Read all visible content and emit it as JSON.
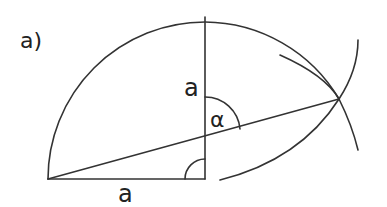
{
  "figure": {
    "panel_label": "a)",
    "labels": {
      "vertical_side": "a",
      "horizontal_side": "a",
      "angle": "α"
    },
    "colors": {
      "stroke": "#333333",
      "background": "#ffffff"
    }
  }
}
